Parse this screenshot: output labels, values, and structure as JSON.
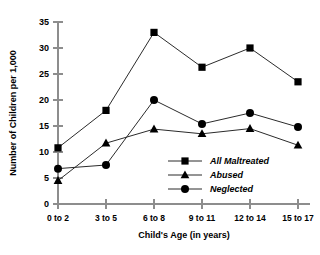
{
  "chart_data": {
    "type": "line",
    "title": "",
    "xlabel": "Child's Age (in years)",
    "ylabel": "Number of Children per 1,000",
    "categories": [
      "0 to 2",
      "3 to 5",
      "6 to 8",
      "9 to 11",
      "12 to 14",
      "15 to 17"
    ],
    "series": [
      {
        "name": "All Maltreated",
        "marker": "square",
        "color": "#000000",
        "values": [
          10.8,
          18.0,
          33.0,
          26.3,
          30.0,
          23.5
        ]
      },
      {
        "name": "Abused",
        "marker": "triangle",
        "color": "#000000",
        "values": [
          4.5,
          11.7,
          14.4,
          13.5,
          14.5,
          11.3
        ]
      },
      {
        "name": "Neglected",
        "marker": "circle",
        "color": "#000000",
        "values": [
          6.8,
          7.5,
          20.0,
          15.4,
          17.5,
          14.8
        ]
      }
    ],
    "ylim": [
      0,
      35
    ],
    "yticks": [
      0,
      5,
      10,
      15,
      20,
      25,
      30,
      35
    ],
    "ytick_labels": [
      "0",
      "5",
      "10",
      "15",
      "20",
      "25",
      "30",
      "35"
    ],
    "grid": false,
    "legend_position": "inside-lower-right",
    "axis_color": "#8d8d8d",
    "line_color": "#2b2b2b",
    "background": "#ffffff"
  },
  "legend": {
    "entries": [
      {
        "label": "All Maltreated",
        "marker": "square-marker-icon"
      },
      {
        "label": "Abused",
        "marker": "triangle-marker-icon"
      },
      {
        "label": "Neglected",
        "marker": "circle-marker-icon"
      }
    ]
  }
}
